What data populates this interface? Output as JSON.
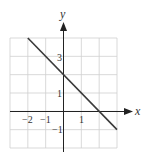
{
  "chart_data": {
    "type": "line",
    "title": "",
    "xlabel": "x",
    "ylabel": "y",
    "xlim": [
      -3,
      3
    ],
    "ylim": [
      -2,
      4
    ],
    "grid": true,
    "x_ticks": [
      {
        "value": -2,
        "label": "−2"
      },
      {
        "value": -1,
        "label": "−1"
      },
      {
        "value": 1,
        "label": "1"
      }
    ],
    "y_ticks": [
      {
        "value": 3,
        "label": "3"
      },
      {
        "value": 1,
        "label": "1"
      },
      {
        "value": -1,
        "label": "−1"
      }
    ],
    "series": [
      {
        "name": "y = -x + 2",
        "x": [
          -2,
          3
        ],
        "y": [
          4,
          -1
        ],
        "color": "#3a3a3a"
      }
    ],
    "colors": {
      "grid": "#cfcfcf",
      "axis": "#222222",
      "line": "#3a3a3a"
    }
  }
}
